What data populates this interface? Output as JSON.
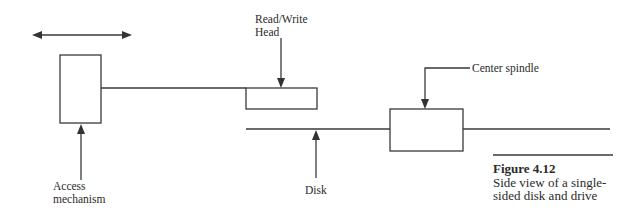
{
  "labels": {
    "read_write_head": [
      "Read/Write",
      "Head"
    ],
    "center_spindle": "Center spindle",
    "access_mechanism": [
      "Access",
      "mechanism"
    ],
    "disk": "Disk"
  },
  "caption": {
    "figure": "Figure 4.12",
    "text": [
      "Side view of a single-",
      "sided disk and drive"
    ]
  },
  "colors": {
    "line": "#3a3a3a",
    "text": "#2a2a2a",
    "background": "#ffffff"
  }
}
